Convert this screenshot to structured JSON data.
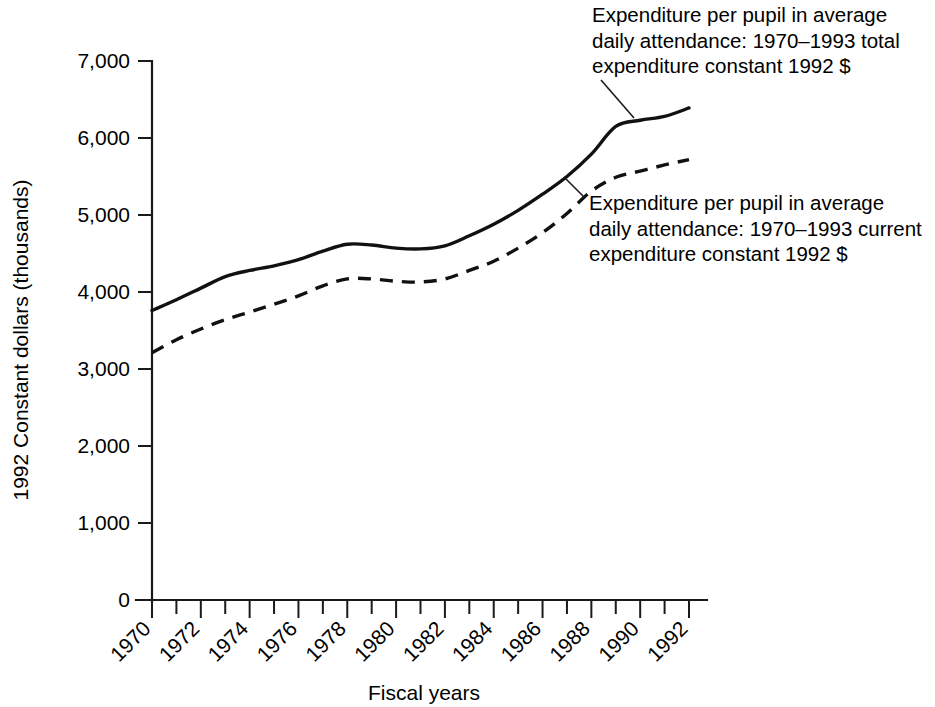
{
  "chart_data": {
    "type": "line",
    "title": "",
    "xlabel": "Fiscal years",
    "ylabel": "1992 Constant dollars (thousands)",
    "xlim": [
      1970,
      1992
    ],
    "ylim": [
      0,
      7000
    ],
    "grid": false,
    "legend_position": "inline-annotations",
    "y_ticks": [
      0,
      1000,
      2000,
      3000,
      4000,
      5000,
      6000,
      7000
    ],
    "y_tick_labels": [
      "0",
      "1,000",
      "2,000",
      "3,000",
      "4,000",
      "5,000",
      "6,000",
      "7,000"
    ],
    "x_ticks": [
      1970,
      1971,
      1972,
      1973,
      1974,
      1975,
      1976,
      1977,
      1978,
      1979,
      1980,
      1981,
      1982,
      1983,
      1984,
      1985,
      1986,
      1987,
      1988,
      1989,
      1990,
      1991,
      1992
    ],
    "x_tick_labels": [
      "1970",
      "",
      "1972",
      "",
      "1974",
      "",
      "1976",
      "",
      "1978",
      "",
      "1980",
      "",
      "1982",
      "",
      "1984",
      "",
      "1986",
      "",
      "1988",
      "",
      "1990",
      "",
      "1992"
    ],
    "x": [
      1970,
      1971,
      1972,
      1973,
      1974,
      1975,
      1976,
      1977,
      1978,
      1979,
      1980,
      1981,
      1982,
      1983,
      1984,
      1985,
      1986,
      1987,
      1988,
      1989,
      1990,
      1991,
      1992
    ],
    "series": [
      {
        "name": "Expenditure per pupil in average daily attendance: 1970–1993 total expenditure constant 1992 $",
        "style": "solid",
        "values": [
          3760,
          3900,
          4050,
          4200,
          4280,
          4340,
          4420,
          4530,
          4620,
          4610,
          4570,
          4560,
          4600,
          4730,
          4880,
          5060,
          5270,
          5500,
          5790,
          6150,
          6230,
          6280,
          6390
        ]
      },
      {
        "name": "Expenditure per pupil in average daily attendance: 1970–1993 current expenditure constant 1992 $",
        "style": "dashed",
        "values": [
          3210,
          3380,
          3520,
          3640,
          3740,
          3840,
          3950,
          4080,
          4170,
          4170,
          4140,
          4130,
          4170,
          4280,
          4400,
          4570,
          4770,
          5020,
          5310,
          5490,
          5570,
          5650,
          5720
        ]
      }
    ],
    "annotations": [
      {
        "id": "annotation-total-expenditure",
        "lines": [
          "Expenditure per pupil in average",
          "daily attendance: 1970–1993 total",
          "expenditure constant 1992 $"
        ],
        "text_x": 592,
        "text_y": 22,
        "leader": {
          "x1": 601,
          "y1": 80,
          "x2": 634,
          "y2": 118
        }
      },
      {
        "id": "annotation-current-expenditure",
        "lines": [
          "Expenditure per pupil in average",
          "daily attendance: 1970–1993 current",
          "expenditure constant 1992 $"
        ],
        "text_x": 589,
        "text_y": 210,
        "leader": {
          "x1": 584,
          "y1": 197,
          "x2": 564,
          "y2": 177
        }
      }
    ],
    "colors": {
      "line": "#111111",
      "axis": "#1a1a1a",
      "background": "#ffffff"
    }
  }
}
